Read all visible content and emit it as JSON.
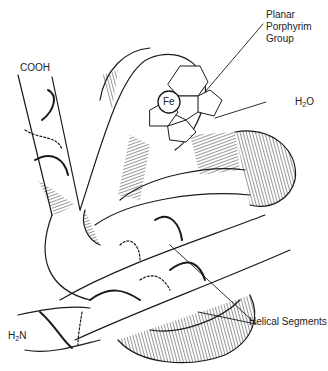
{
  "diagram": {
    "labels": {
      "porphyrin_line1": "Planar",
      "porphyrin_line2": "Porphyrim",
      "porphyrin_line3": "Group",
      "cooh": "COOH",
      "h2o_main": "H",
      "h2o_sub": "2",
      "h2o_tail": "O",
      "h2n_main": "H",
      "h2n_sub": "2",
      "h2n_tail": "N",
      "iron": "Fe",
      "helical": "Helical Segments"
    },
    "colors": {
      "ink": "#1a1a1a",
      "background": "#ffffff",
      "label": "#222222"
    }
  }
}
